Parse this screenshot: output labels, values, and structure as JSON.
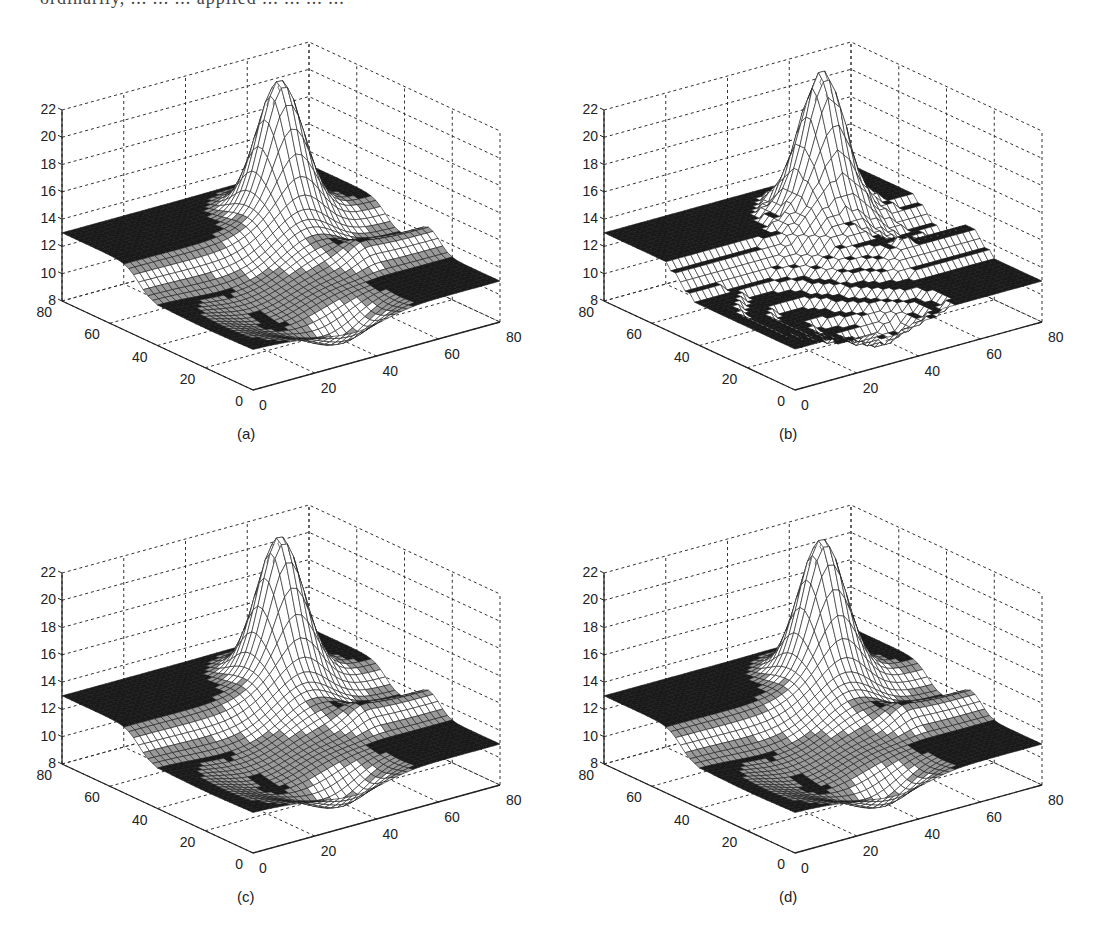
{
  "figure": {
    "top_text_clipped": "ordinarily, ... ... ... applied ... ... ... ..."
  },
  "chart_data": [
    {
      "id": "a",
      "type": "surface3d",
      "caption": "(a)",
      "style": "smooth mesh",
      "x_ticks": [
        "0",
        "20",
        "40",
        "60",
        "80"
      ],
      "y_ticks": [
        "0",
        "20",
        "40",
        "60",
        "80"
      ],
      "z_ticks": [
        "8",
        "10",
        "12",
        "14",
        "16",
        "18",
        "20",
        "22"
      ],
      "xlim": [
        0,
        80
      ],
      "ylim": [
        0,
        80
      ],
      "zlim": [
        8,
        22
      ],
      "grid": true,
      "peak": {
        "x": 55,
        "y": 60,
        "z": 22.0
      },
      "base_level": 11,
      "plateau_level": 13,
      "quantized": false
    },
    {
      "id": "b",
      "type": "surface3d",
      "caption": "(b)",
      "style": "stepped (quantized) mesh",
      "x_ticks": [
        "0",
        "20",
        "40",
        "60",
        "80"
      ],
      "y_ticks": [
        "0",
        "20",
        "40",
        "60",
        "80"
      ],
      "z_ticks": [
        "8",
        "10",
        "12",
        "14",
        "16",
        "18",
        "20",
        "22"
      ],
      "xlim": [
        0,
        80
      ],
      "ylim": [
        0,
        80
      ],
      "zlim": [
        8,
        22
      ],
      "grid": true,
      "peak": {
        "x": 55,
        "y": 60,
        "z": 22.5
      },
      "base_level": 11,
      "plateau_level": 13,
      "quantized": true
    },
    {
      "id": "c",
      "type": "surface3d",
      "caption": "(c)",
      "style": "smoothed stepped mesh",
      "x_ticks": [
        "0",
        "20",
        "40",
        "60",
        "80"
      ],
      "y_ticks": [
        "0",
        "20",
        "40",
        "60",
        "80"
      ],
      "z_ticks": [
        "8",
        "10",
        "12",
        "14",
        "16",
        "18",
        "20",
        "22"
      ],
      "xlim": [
        0,
        80
      ],
      "ylim": [
        0,
        80
      ],
      "zlim": [
        8,
        22
      ],
      "grid": true,
      "peak": {
        "x": 55,
        "y": 60,
        "z": 22.5
      },
      "base_level": 11,
      "plateau_level": 13,
      "quantized": false
    },
    {
      "id": "d",
      "type": "surface3d",
      "caption": "(d)",
      "style": "smoothed stepped mesh",
      "x_ticks": [
        "0",
        "20",
        "40",
        "60",
        "80"
      ],
      "y_ticks": [
        "0",
        "20",
        "40",
        "60",
        "80"
      ],
      "z_ticks": [
        "8",
        "10",
        "12",
        "14",
        "16",
        "18",
        "20",
        "22"
      ],
      "xlim": [
        0,
        80
      ],
      "ylim": [
        0,
        80
      ],
      "zlim": [
        8,
        22
      ],
      "grid": true,
      "peak": {
        "x": 55,
        "y": 60,
        "z": 22.3
      },
      "base_level": 11,
      "plateau_level": 13,
      "quantized": false
    }
  ],
  "layout": {
    "panels": [
      {
        "id": "a",
        "left": 0,
        "top": 0
      },
      {
        "id": "b",
        "left": 542,
        "top": 0
      },
      {
        "id": "c",
        "left": 0,
        "top": 463
      },
      {
        "id": "d",
        "left": 542,
        "top": 463
      }
    ]
  }
}
